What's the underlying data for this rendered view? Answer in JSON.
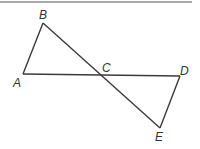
{
  "diagram": {
    "type": "geometry",
    "colors": {
      "stroke": "#3a3a3a",
      "label": "#333333",
      "rule": "#555555"
    },
    "top_rule": {
      "x1": 0,
      "y1": 2,
      "x2": 192,
      "y2": 2
    },
    "points": {
      "A": {
        "x": 23,
        "y": 74
      },
      "B": {
        "x": 43,
        "y": 23
      },
      "C": {
        "x": 100,
        "y": 75
      },
      "D": {
        "x": 180,
        "y": 76
      },
      "E": {
        "x": 160,
        "y": 128
      }
    },
    "segments": [
      {
        "name": "AB",
        "from": "A",
        "to": "B"
      },
      {
        "name": "BE",
        "from": "B",
        "to": "E"
      },
      {
        "name": "AD",
        "from": "A",
        "to": "D"
      },
      {
        "name": "DE",
        "from": "D",
        "to": "E"
      }
    ],
    "labels": [
      {
        "text": "A",
        "x": 13,
        "y": 87
      },
      {
        "text": "B",
        "x": 39,
        "y": 19
      },
      {
        "text": "C",
        "x": 102,
        "y": 72
      },
      {
        "text": "D",
        "x": 180,
        "y": 75
      },
      {
        "text": "E",
        "x": 155,
        "y": 141
      }
    ]
  }
}
